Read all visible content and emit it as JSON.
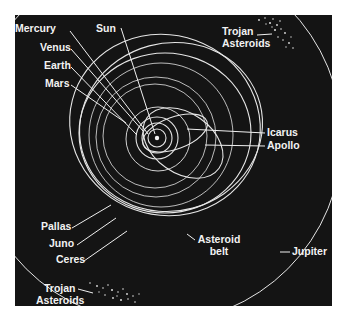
{
  "diagram": {
    "type": "solar-system-orbits",
    "colors": {
      "background": "#141414",
      "orbit": "#e8e8e8",
      "text": "#f2f2f2",
      "page": "#ffffff"
    },
    "labels": {
      "mercury": "Mercury",
      "sun": "Sun",
      "venus": "Venus",
      "earth": "Earth",
      "mars": "Mars",
      "trojan_top_1": "Trojan",
      "trojan_top_2": "Asteroids",
      "icarus": "Icarus",
      "apollo": "Apollo",
      "pallas": "Pallas",
      "juno": "Juno",
      "ceres": "Ceres",
      "asteroid_belt_1": "Asteroid",
      "asteroid_belt_2": "belt",
      "jupiter": "Jupiter",
      "trojan_bottom_1": "Trojan",
      "trojan_bottom_2": "Asteroids"
    }
  }
}
